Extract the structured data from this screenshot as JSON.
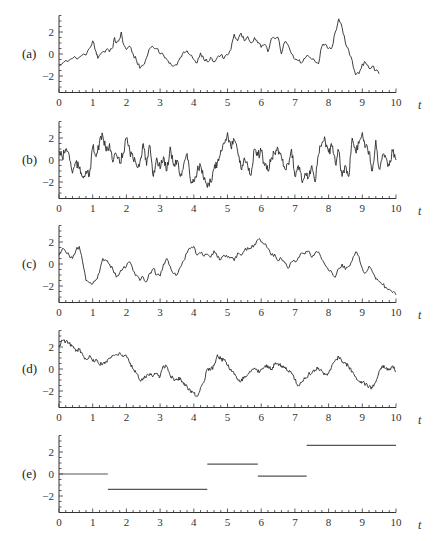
{
  "chart_data": [
    {
      "panel": "(a)",
      "type": "line",
      "xlabel": "t",
      "xlim": [
        0,
        10
      ],
      "ylim": [
        -3.5,
        3.5
      ],
      "xticks": [
        "0",
        "1",
        "2",
        "3",
        "4",
        "5",
        "6",
        "7",
        "8",
        "9",
        "10"
      ],
      "yticks": [
        "2",
        "0",
        "−2"
      ],
      "x": [
        0,
        0.2,
        0.4,
        0.6,
        0.8,
        0.9,
        1.0,
        1.1,
        1.15,
        1.3,
        1.4,
        1.5,
        1.6,
        1.65,
        1.7,
        1.8,
        1.85,
        1.9,
        2.0,
        2.1,
        2.2,
        2.3,
        2.4,
        2.5,
        2.6,
        2.7,
        2.8,
        2.9,
        3.0,
        3.1,
        3.2,
        3.3,
        3.4,
        3.5,
        3.6,
        3.7,
        3.8,
        3.9,
        4.0,
        4.1,
        4.2,
        4.3,
        4.4,
        4.5,
        4.6,
        4.7,
        4.8,
        4.9,
        5.0,
        5.1,
        5.2,
        5.3,
        5.4,
        5.5,
        5.6,
        5.7,
        5.8,
        5.9,
        6.0,
        6.1,
        6.2,
        6.3,
        6.4,
        6.5,
        6.6,
        6.7,
        6.8,
        6.9,
        7.0,
        7.1,
        7.2,
        7.3,
        7.4,
        7.5,
        7.6,
        7.7,
        7.8,
        7.9,
        8.0,
        8.1,
        8.2,
        8.3,
        8.4,
        8.5,
        8.6,
        8.7,
        8.8,
        8.9,
        9.0,
        9.1,
        9.2,
        9.3,
        9.4,
        9.5,
        9.6,
        9.7,
        9.8,
        9.9,
        10.0
      ],
      "values": [
        -1.0,
        -0.6,
        -0.4,
        -0.3,
        -0.1,
        0.5,
        1.2,
        0.2,
        -0.4,
        0.2,
        0.4,
        0.2,
        0.6,
        1.5,
        1.0,
        1.4,
        2.0,
        1.0,
        0.4,
        0.7,
        0.0,
        -0.6,
        -1.3,
        -1.0,
        -0.3,
        0.5,
        0.6,
        0.5,
        0.0,
        -0.1,
        -0.5,
        -0.8,
        -1.1,
        -1.0,
        -0.3,
        0.2,
        0.3,
        -0.1,
        -0.5,
        -0.8,
        0.1,
        -0.5,
        -0.7,
        -0.3,
        -0.7,
        -0.3,
        -0.1,
        -0.4,
        -0.1,
        0.4,
        1.8,
        1.2,
        1.9,
        1.2,
        1.6,
        1.0,
        1.5,
        1.0,
        0.6,
        0.9,
        0.2,
        1.4,
        1.4,
        1.5,
        0.0,
        1.1,
        0.8,
        0.0,
        -0.5,
        -0.6,
        -0.8,
        -0.4,
        -0.2,
        -0.5,
        -0.7,
        -0.9,
        0.7,
        0.9,
        0.5,
        0.6,
        2.0,
        3.2,
        2.4,
        1.0,
        0.3,
        -0.6,
        -1.9,
        -1.8,
        -0.9,
        -0.8,
        -1.3,
        -1.1,
        -1.5,
        -1.8
      ]
    },
    {
      "panel": "(b)",
      "type": "line",
      "xlabel": "t",
      "xlim": [
        0,
        10
      ],
      "ylim": [
        -3.5,
        3.5
      ],
      "xticks": [
        "0",
        "1",
        "2",
        "3",
        "4",
        "5",
        "6",
        "7",
        "8",
        "9",
        "10"
      ],
      "yticks": [
        "2",
        "0",
        "−2"
      ],
      "x": [
        0,
        0.1,
        0.2,
        0.3,
        0.4,
        0.5,
        0.6,
        0.7,
        0.8,
        0.9,
        1.0,
        1.1,
        1.2,
        1.3,
        1.4,
        1.5,
        1.6,
        1.7,
        1.8,
        1.9,
        2.0,
        2.1,
        2.2,
        2.3,
        2.4,
        2.5,
        2.6,
        2.7,
        2.8,
        2.9,
        3.0,
        3.1,
        3.2,
        3.3,
        3.4,
        3.5,
        3.6,
        3.7,
        3.8,
        3.9,
        4.0,
        4.1,
        4.2,
        4.3,
        4.4,
        4.5,
        4.6,
        4.7,
        4.8,
        4.9,
        5.0,
        5.1,
        5.2,
        5.3,
        5.4,
        5.5,
        5.6,
        5.7,
        5.8,
        5.9,
        6.0,
        6.1,
        6.2,
        6.3,
        6.4,
        6.5,
        6.6,
        6.7,
        6.8,
        6.9,
        7.0,
        7.1,
        7.2,
        7.3,
        7.4,
        7.5,
        7.6,
        7.7,
        7.8,
        7.9,
        8.0,
        8.1,
        8.2,
        8.3,
        8.4,
        8.5,
        8.6,
        8.7,
        8.8,
        8.9,
        9.0,
        9.1,
        9.2,
        9.3,
        9.4,
        9.5,
        9.6,
        9.7,
        9.8,
        9.9,
        10.0
      ],
      "values": [
        0.8,
        0.2,
        1.0,
        0.5,
        -1.2,
        -0.2,
        -0.8,
        -1.5,
        -1.0,
        -1.5,
        1.2,
        0.3,
        1.5,
        2.2,
        0.8,
        1.5,
        -0.2,
        0.5,
        -0.3,
        0.6,
        2.0,
        0.8,
        0.1,
        -0.5,
        -0.2,
        1.5,
        -0.5,
        1.3,
        -1.5,
        0.2,
        -0.8,
        0.3,
        -1.0,
        1.2,
        -0.5,
        0.0,
        -1.5,
        -0.4,
        0.6,
        -1.8,
        -2.0,
        -1.0,
        -0.5,
        -1.8,
        -2.5,
        -2.0,
        -0.8,
        -0.2,
        0.9,
        1.5,
        2.5,
        1.2,
        1.8,
        0.8,
        -0.8,
        0.2,
        -0.5,
        -1.4,
        1.0,
        0.4,
        0.8,
        -0.5,
        -1.0,
        0.2,
        0.6,
        1.0,
        0.3,
        -0.8,
        -0.3,
        1.0,
        -1.5,
        -0.5,
        -1.8,
        -1.2,
        -1.6,
        -0.5,
        -2.0,
        0.5,
        1.5,
        1.8,
        0.7,
        1.2,
        -0.3,
        0.8,
        -1.5,
        -0.5,
        -1.5,
        2.0,
        0.8,
        1.5,
        2.5,
        1.2,
        0.8,
        -1.0,
        1.8,
        -0.8,
        0.5,
        0.2,
        -0.5,
        0.8,
        0.0
      ]
    },
    {
      "panel": "(c)",
      "type": "line",
      "xlabel": "t",
      "xlim": [
        0,
        10
      ],
      "ylim": [
        -3.5,
        3.5
      ],
      "xticks": [
        "0",
        "1",
        "2",
        "3",
        "4",
        "5",
        "6",
        "7",
        "8",
        "9",
        "10"
      ],
      "yticks": [
        "2",
        "0",
        "−2"
      ],
      "x": [
        0,
        0.1,
        0.2,
        0.3,
        0.4,
        0.5,
        0.6,
        0.7,
        0.8,
        0.9,
        1.0,
        1.1,
        1.2,
        1.3,
        1.4,
        1.5,
        1.6,
        1.7,
        1.8,
        1.9,
        2.0,
        2.1,
        2.2,
        2.3,
        2.4,
        2.5,
        2.6,
        2.7,
        2.8,
        2.9,
        3.0,
        3.1,
        3.2,
        3.3,
        3.4,
        3.5,
        3.6,
        3.7,
        3.8,
        3.9,
        4.0,
        4.1,
        4.2,
        4.3,
        4.4,
        4.5,
        4.6,
        4.7,
        4.8,
        4.9,
        5.0,
        5.1,
        5.2,
        5.3,
        5.4,
        5.5,
        5.6,
        5.7,
        5.8,
        5.9,
        6.0,
        6.1,
        6.2,
        6.3,
        6.4,
        6.5,
        6.6,
        6.7,
        6.8,
        6.9,
        7.0,
        7.1,
        7.2,
        7.3,
        7.4,
        7.5,
        7.6,
        7.7,
        7.8,
        7.9,
        8.0,
        8.1,
        8.2,
        8.3,
        8.4,
        8.5,
        8.6,
        8.7,
        8.8,
        8.9,
        9.0,
        9.1,
        9.2,
        9.3,
        9.4,
        9.5,
        9.6,
        9.7,
        9.8,
        9.9,
        10.0
      ],
      "values": [
        0.8,
        1.4,
        1.1,
        0.8,
        0.5,
        1.2,
        1.6,
        0.2,
        -1.5,
        -1.7,
        -1.8,
        -1.4,
        -0.8,
        0.5,
        0.3,
        0.0,
        -0.5,
        -1.2,
        -0.8,
        -0.4,
        -0.2,
        0.2,
        -0.6,
        -1.0,
        -1.5,
        -1.2,
        -1.6,
        -0.8,
        -0.4,
        -1.0,
        -1.1,
        0.0,
        0.5,
        -0.2,
        -0.9,
        -1.0,
        -0.3,
        0.3,
        1.0,
        1.4,
        1.6,
        0.8,
        1.0,
        0.7,
        0.9,
        0.6,
        1.2,
        0.6,
        0.4,
        0.8,
        0.6,
        0.6,
        0.3,
        1.0,
        0.8,
        1.2,
        1.5,
        1.4,
        1.8,
        2.2,
        2.0,
        1.8,
        1.4,
        0.8,
        0.9,
        0.3,
        0.5,
        0.1,
        -0.4,
        0.2,
        0.2,
        0.6,
        1.0,
        0.9,
        1.2,
        0.6,
        1.0,
        1.1,
        0.4,
        -0.1,
        -0.6,
        -0.8,
        -1.2,
        -0.4,
        0.0,
        -0.5,
        -0.2,
        0.3,
        1.1,
        0.7,
        -0.4,
        -0.8,
        -0.2,
        -0.7,
        -1.4,
        -1.6,
        -1.9,
        -2.1,
        -2.3,
        -2.6,
        -2.8
      ]
    },
    {
      "panel": "(d)",
      "type": "line",
      "xlabel": "t",
      "xlim": [
        0,
        10
      ],
      "ylim": [
        -3.5,
        3.5
      ],
      "xticks": [
        "0",
        "1",
        "2",
        "3",
        "4",
        "5",
        "6",
        "7",
        "8",
        "9",
        "10"
      ],
      "yticks": [
        "2",
        "0",
        "−2"
      ],
      "x": [
        0,
        0.1,
        0.2,
        0.3,
        0.4,
        0.5,
        0.6,
        0.7,
        0.8,
        0.9,
        1.0,
        1.1,
        1.2,
        1.3,
        1.4,
        1.5,
        1.6,
        1.7,
        1.8,
        1.9,
        2.0,
        2.1,
        2.2,
        2.3,
        2.4,
        2.5,
        2.6,
        2.7,
        2.8,
        2.9,
        3.0,
        3.1,
        3.2,
        3.3,
        3.4,
        3.5,
        3.6,
        3.7,
        3.8,
        3.9,
        4.0,
        4.1,
        4.2,
        4.3,
        4.4,
        4.5,
        4.6,
        4.7,
        4.8,
        4.9,
        5.0,
        5.1,
        5.2,
        5.3,
        5.4,
        5.5,
        5.6,
        5.7,
        5.8,
        5.9,
        6.0,
        6.1,
        6.2,
        6.3,
        6.4,
        6.5,
        6.6,
        6.7,
        6.8,
        6.9,
        7.0,
        7.1,
        7.2,
        7.3,
        7.4,
        7.5,
        7.6,
        7.7,
        7.8,
        7.9,
        8.0,
        8.1,
        8.2,
        8.3,
        8.4,
        8.5,
        8.6,
        8.7,
        8.8,
        8.9,
        9.0,
        9.1,
        9.2,
        9.3,
        9.4,
        9.5,
        9.6,
        9.7,
        9.8,
        9.9,
        10.0
      ],
      "values": [
        2.0,
        2.6,
        2.5,
        2.3,
        2.1,
        1.6,
        1.8,
        1.3,
        0.9,
        1.2,
        0.7,
        0.9,
        0.4,
        0.5,
        0.7,
        1.0,
        1.2,
        1.3,
        1.5,
        1.1,
        1.2,
        0.5,
        0.0,
        -0.4,
        -1.0,
        -0.8,
        -0.6,
        -0.4,
        -0.6,
        -0.4,
        -0.7,
        0.3,
        0.2,
        -0.6,
        -0.9,
        -1.0,
        -0.8,
        -1.4,
        -1.6,
        -2.0,
        -2.2,
        -2.5,
        -1.7,
        -1.2,
        0.0,
        -0.1,
        0.3,
        1.3,
        0.9,
        0.8,
        0.3,
        0.0,
        -0.5,
        -0.9,
        -1.1,
        -0.7,
        -0.5,
        -0.2,
        0.1,
        -0.3,
        0.0,
        0.2,
        0.3,
        0.0,
        0.4,
        0.5,
        0.3,
        0.2,
        -0.2,
        -0.4,
        -1.0,
        -1.5,
        -1.2,
        -0.9,
        -0.5,
        -0.4,
        -0.1,
        0.1,
        -0.2,
        -0.5,
        -0.4,
        0.4,
        0.8,
        1.1,
        0.6,
        0.5,
        0.2,
        -0.2,
        -0.7,
        -1.1,
        -1.2,
        -1.4,
        -1.6,
        -1.7,
        -1.2,
        -0.2,
        0.3,
        0.1,
        -0.1,
        0.3,
        -0.2
      ]
    },
    {
      "panel": "(e)",
      "type": "line",
      "subtype": "step",
      "xlabel": "t",
      "xlim": [
        0,
        10
      ],
      "ylim": [
        -3.5,
        3.5
      ],
      "xticks": [
        "0",
        "1",
        "2",
        "3",
        "4",
        "5",
        "6",
        "7",
        "8",
        "9",
        "10"
      ],
      "yticks": [
        "2",
        "0",
        "−2"
      ],
      "segments": [
        {
          "x0": 0.0,
          "x1": 1.45,
          "y": 0.0
        },
        {
          "x0": 1.45,
          "x1": 4.4,
          "y": -1.4
        },
        {
          "x0": 4.4,
          "x1": 5.9,
          "y": 0.9
        },
        {
          "x0": 5.9,
          "x1": 7.35,
          "y": -0.2
        },
        {
          "x0": 7.35,
          "x1": 10.0,
          "y": 2.6
        }
      ]
    }
  ],
  "panels": [
    {
      "label": "(a)"
    },
    {
      "label": "(b)"
    },
    {
      "label": "(c)"
    },
    {
      "label": "(d)"
    },
    {
      "label": "(e)"
    }
  ],
  "axis": {
    "t_label": "t",
    "xticks": [
      "0",
      "1",
      "2",
      "3",
      "4",
      "5",
      "6",
      "7",
      "8",
      "9",
      "10"
    ],
    "yticks": [
      "2",
      "0",
      "−2"
    ]
  }
}
